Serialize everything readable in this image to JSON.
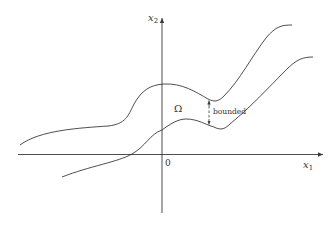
{
  "figure": {
    "axes": {
      "x_label": "x",
      "x_label_sub": "1",
      "y_label": "x",
      "y_label_sub": "2",
      "origin_label": "0"
    },
    "region_label": "Ω",
    "annotation": "bounded",
    "colors": {
      "stroke": "#3a3a3a",
      "text": "#333333",
      "background": "#ffffff"
    }
  }
}
